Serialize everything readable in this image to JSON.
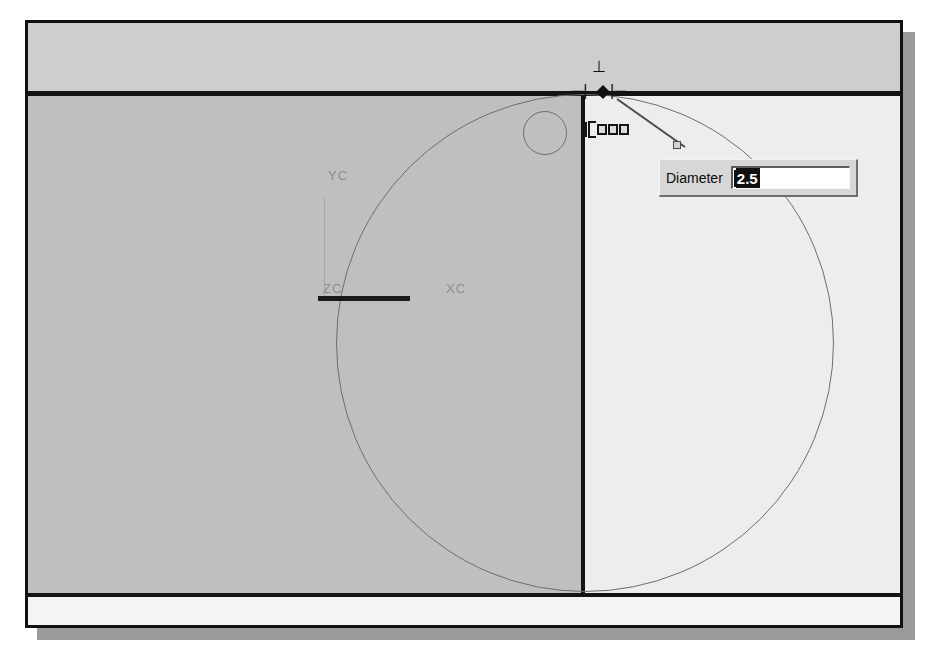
{
  "window": {
    "background_color": "#c2c2c2",
    "border_color": "#111111",
    "shadow_color": "#9a9a9a"
  },
  "viewport": {
    "left_face_color": "#bfbfbf",
    "right_face_color": "#ededed",
    "top_band_color": "#cecece",
    "bottom_band_color": "#f4f4f4",
    "edge_line_color": "#141414",
    "geometry_line_color": "#6e6e6e"
  },
  "wcs": {
    "label_yc_top": "YC",
    "label_zc": "ZC",
    "label_xc": "XC",
    "label_color": "#8e8e8e"
  },
  "cursor": {
    "snap_up_glyph": "⊥",
    "snap_left_glyph": "─|",
    "snap_right_glyph": "|─",
    "icon_names": [
      "snap-indicator-icon",
      "point-marker-icon",
      "constraint-chips-icon"
    ]
  },
  "dialog": {
    "label": "Diameter",
    "value": "2.5",
    "value_selected": true,
    "selection_bg": "#101010",
    "selection_fg": "#ffffff",
    "field_bg": "#ffffff",
    "dialog_bg": "#d7d7d7"
  },
  "geometry": {
    "big_circle_diameter_px": 498,
    "small_circle_diameter_px": 44,
    "vertical_datum_x_px": 553,
    "top_datum_y_px": 68,
    "bottom_datum_y_px": 570
  }
}
